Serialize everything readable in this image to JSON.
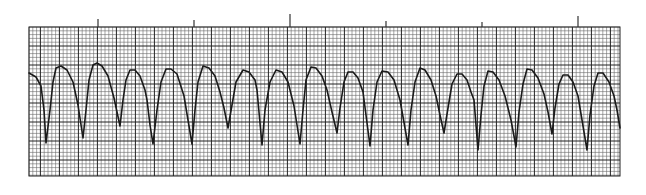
{
  "image": {
    "subject": "ECG rhythm strip",
    "width": 646,
    "height": 195,
    "background_color": "#ffffff",
    "grid": {
      "left": 29,
      "top": 27,
      "right": 620,
      "bottom": 176,
      "small_square_px": 3.8,
      "large_square_px": 19,
      "minor_line_color": "#6a6a6a",
      "major_line_color": "#222222"
    },
    "timing_marks": [
      {
        "x": 98,
        "top": 19
      },
      {
        "x": 194,
        "top": 20
      },
      {
        "x": 290,
        "top": 14
      },
      {
        "x": 386,
        "top": 21
      },
      {
        "x": 482,
        "top": 22
      },
      {
        "x": 578,
        "top": 16
      }
    ],
    "trace": {
      "color": "#1a1a1a",
      "width": 1.6,
      "points": [
        [
          29,
          73
        ],
        [
          36,
          77
        ],
        [
          41,
          86
        ],
        [
          44,
          110
        ],
        [
          46,
          143
        ],
        [
          50,
          110
        ],
        [
          53,
          82
        ],
        [
          56,
          68
        ],
        [
          61,
          66
        ],
        [
          67,
          70
        ],
        [
          73,
          82
        ],
        [
          78,
          105
        ],
        [
          83,
          138
        ],
        [
          86,
          110
        ],
        [
          89,
          80
        ],
        [
          93,
          65
        ],
        [
          97,
          63
        ],
        [
          102,
          66
        ],
        [
          108,
          76
        ],
        [
          114,
          98
        ],
        [
          120,
          126
        ],
        [
          123,
          100
        ],
        [
          126,
          80
        ],
        [
          130,
          70
        ],
        [
          135,
          70
        ],
        [
          140,
          76
        ],
        [
          145,
          90
        ],
        [
          147,
          100
        ],
        [
          150,
          125
        ],
        [
          153,
          144
        ],
        [
          157,
          110
        ],
        [
          161,
          82
        ],
        [
          166,
          69
        ],
        [
          171,
          69
        ],
        [
          177,
          74
        ],
        [
          184,
          96
        ],
        [
          192,
          144
        ],
        [
          195,
          110
        ],
        [
          198,
          82
        ],
        [
          203,
          66
        ],
        [
          209,
          68
        ],
        [
          215,
          76
        ],
        [
          220,
          92
        ],
        [
          224,
          108
        ],
        [
          228,
          128
        ],
        [
          232,
          105
        ],
        [
          236,
          82
        ],
        [
          243,
          70
        ],
        [
          249,
          72
        ],
        [
          255,
          80
        ],
        [
          257,
          90
        ],
        [
          262,
          145
        ],
        [
          265,
          110
        ],
        [
          270,
          82
        ],
        [
          276,
          70
        ],
        [
          282,
          72
        ],
        [
          288,
          82
        ],
        [
          294,
          106
        ],
        [
          300,
          144
        ],
        [
          303,
          110
        ],
        [
          306,
          80
        ],
        [
          311,
          67
        ],
        [
          316,
          68
        ],
        [
          322,
          76
        ],
        [
          327,
          90
        ],
        [
          332,
          112
        ],
        [
          337,
          133
        ],
        [
          340,
          108
        ],
        [
          344,
          82
        ],
        [
          348,
          72
        ],
        [
          353,
          72
        ],
        [
          358,
          78
        ],
        [
          363,
          92
        ],
        [
          370,
          146
        ],
        [
          373,
          110
        ],
        [
          377,
          82
        ],
        [
          382,
          71
        ],
        [
          388,
          72
        ],
        [
          394,
          80
        ],
        [
          400,
          100
        ],
        [
          408,
          145
        ],
        [
          411,
          110
        ],
        [
          415,
          82
        ],
        [
          420,
          68
        ],
        [
          425,
          70
        ],
        [
          431,
          80
        ],
        [
          436,
          96
        ],
        [
          440,
          115
        ],
        [
          444,
          133
        ],
        [
          448,
          108
        ],
        [
          452,
          84
        ],
        [
          457,
          74
        ],
        [
          462,
          74
        ],
        [
          467,
          80
        ],
        [
          471,
          92
        ],
        [
          474,
          100
        ],
        [
          478,
          150
        ],
        [
          481,
          115
        ],
        [
          484,
          86
        ],
        [
          488,
          71
        ],
        [
          493,
          72
        ],
        [
          499,
          80
        ],
        [
          505,
          96
        ],
        [
          511,
          120
        ],
        [
          516,
          147
        ],
        [
          519,
          112
        ],
        [
          523,
          84
        ],
        [
          527,
          69
        ],
        [
          532,
          70
        ],
        [
          538,
          78
        ],
        [
          544,
          94
        ],
        [
          548,
          112
        ],
        [
          552,
          134
        ],
        [
          555,
          108
        ],
        [
          559,
          84
        ],
        [
          563,
          75
        ],
        [
          568,
          75
        ],
        [
          573,
          82
        ],
        [
          578,
          96
        ],
        [
          582,
          120
        ],
        [
          587,
          150
        ],
        [
          590,
          115
        ],
        [
          594,
          86
        ],
        [
          598,
          73
        ],
        [
          603,
          73
        ],
        [
          609,
          82
        ],
        [
          614,
          96
        ],
        [
          617,
          110
        ],
        [
          620,
          128
        ]
      ]
    }
  }
}
